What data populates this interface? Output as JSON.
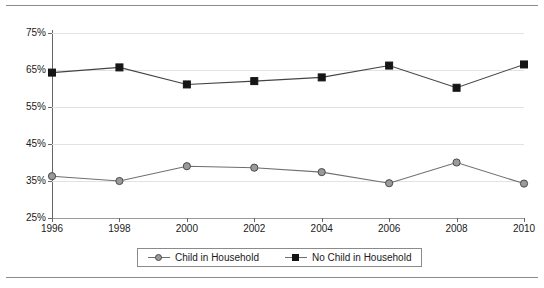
{
  "chart_data": {
    "type": "line",
    "title": "",
    "xlabel": "",
    "ylabel": "",
    "categories": [
      "1996",
      "1998",
      "2000",
      "2002",
      "2004",
      "2006",
      "2008",
      "2010"
    ],
    "x": [
      1996,
      1998,
      2000,
      2002,
      2004,
      2006,
      2008,
      2010
    ],
    "ylim": [
      25,
      75
    ],
    "ytick_labels": [
      "25%",
      "35%",
      "45%",
      "55%",
      "65%",
      "75%"
    ],
    "ytick_values": [
      25,
      35,
      45,
      55,
      65,
      75
    ],
    "grid": "horizontal",
    "legend_position": "bottom-center",
    "series": [
      {
        "name": "Child in Household",
        "marker": "circle",
        "color": "#9a9a9a",
        "line_color": "#6f6f6f",
        "values": [
          36.3,
          35.0,
          39.0,
          38.6,
          37.4,
          34.4,
          40.0,
          34.3
        ]
      },
      {
        "name": "No Child in Household",
        "marker": "square",
        "color": "#151515",
        "line_color": "#444444",
        "values": [
          64.3,
          65.7,
          61.1,
          62.0,
          63.0,
          66.2,
          60.2,
          66.5
        ]
      }
    ]
  },
  "legend": {
    "entries": [
      {
        "label": "Child in Household",
        "marker": "circle"
      },
      {
        "label": "No Child in Household",
        "marker": "square"
      }
    ]
  },
  "axes": {
    "y_labels": [
      "75%",
      "65%",
      "55%",
      "45%",
      "35%",
      "25%"
    ],
    "x_labels": [
      "1996",
      "1998",
      "2000",
      "2002",
      "2004",
      "2006",
      "2008",
      "2010"
    ]
  },
  "colors": {
    "grid": "#e2e2e2",
    "axis": "#666666",
    "rule": "#8b8b8b",
    "series_child": "#9a9a9a",
    "series_nochild": "#151515"
  }
}
